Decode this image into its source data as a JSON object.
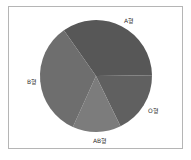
{
  "chart_data": {
    "type": "pie",
    "title": "",
    "categories": [
      "A형",
      "O형",
      "AB형",
      "B형"
    ],
    "values": [
      34.5,
      18,
      14,
      33.5
    ],
    "colors": [
      "#575757",
      "#606060",
      "#7c7c7c",
      "#6e6e6e"
    ],
    "start_angle_deg": -35,
    "direction": "clockwise",
    "legend": "none",
    "labels_outside": true
  },
  "labels": {
    "a": "A형",
    "o": "O형",
    "ab": "AB형",
    "b": "B형"
  }
}
